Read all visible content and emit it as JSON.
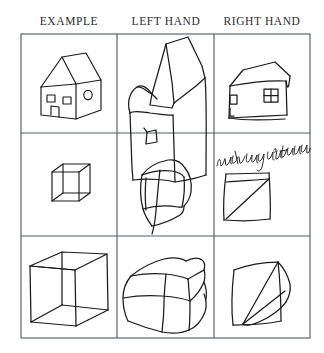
{
  "figure": {
    "background_color": "#ffffff",
    "ink_color": "#1a1a1a",
    "grid_color": "#555f66"
  },
  "columns": [
    {
      "id": "example",
      "label": "EXAMPLE"
    },
    {
      "id": "left_hand",
      "label": "LEFT HAND"
    },
    {
      "id": "right_hand",
      "label": "RIGHT HAND"
    }
  ],
  "grid": {
    "rows": 3,
    "cols": 3,
    "left": 21,
    "top": 34,
    "right": 310,
    "bottom": 338,
    "v_dividers": [
      117,
      214
    ],
    "h_dividers": [
      133,
      236
    ]
  },
  "cells": [
    {
      "row": 1,
      "col": 1,
      "column_id": "example",
      "subject": "house",
      "style": "clean-model-drawing",
      "description": "Three dimensional house with pitched roof, two front windows, a door and one side window"
    },
    {
      "row": 1,
      "col": 2,
      "column_id": "left_hand",
      "subject": "house",
      "style": "distorted-tremulous",
      "description": "Shaky distorted house, roof overshoots the cell border, single small window"
    },
    {
      "row": 1,
      "col": 3,
      "column_id": "right_hand",
      "subject": "house",
      "style": "simplified-flattened",
      "description": "Flattened house outline with small left window and a larger right window"
    },
    {
      "row": 2,
      "col": 1,
      "column_id": "example",
      "subject": "cube",
      "style": "clean-model-drawing",
      "description": "Small transparent wireframe cube"
    },
    {
      "row": 2,
      "col": 2,
      "column_id": "left_hand",
      "subject": "cube",
      "style": "tilted-wobbly",
      "description": "Tilted wobbly cube with overshooting strokes"
    },
    {
      "row": 2,
      "col": 3,
      "column_id": "right_hand",
      "subject": "cube",
      "style": "flat-failed",
      "description": "Flat quadrilateral with a single diagonal, depth not represented",
      "annotation": "with my right hand"
    },
    {
      "row": 3,
      "col": 1,
      "column_id": "example",
      "subject": "cube",
      "style": "clean-model-drawing",
      "description": "Large transparent wireframe cube with visible rear edges"
    },
    {
      "row": 3,
      "col": 2,
      "column_id": "left_hand",
      "subject": "cube",
      "style": "irregular-tremulous",
      "description": "Large irregular cube with wavering lines and broken corners"
    },
    {
      "row": 3,
      "col": 3,
      "column_id": "right_hand",
      "subject": "cube",
      "style": "flat-wedge",
      "description": "Square outline with a narrow triangular wedge on the right side"
    }
  ],
  "annotations": [
    {
      "id": "right-hand-note",
      "text": "with my right hand",
      "handwriting": "cursive",
      "row": 2,
      "col": 3
    }
  ]
}
